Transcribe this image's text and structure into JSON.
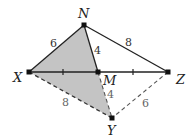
{
  "diagram": {
    "points": {
      "N": {
        "label": "N",
        "x": 84,
        "y": 25
      },
      "X": {
        "label": "X",
        "x": 29,
        "y": 72
      },
      "M": {
        "label": "M",
        "x": 98,
        "y": 72
      },
      "Z": {
        "label": "Z",
        "x": 168,
        "y": 72
      },
      "Y": {
        "label": "Y",
        "x": 112,
        "y": 118
      }
    },
    "segment_labels": {
      "XN": "6",
      "NM": "4",
      "NZ": "8",
      "XY": "8",
      "MY": "4",
      "ZY": "6"
    },
    "shaded_region": "quadrilateral X-N-M-Y",
    "colors": {
      "shade": "#c4c4c4",
      "line": "#222222",
      "dashed": "#444444"
    }
  }
}
